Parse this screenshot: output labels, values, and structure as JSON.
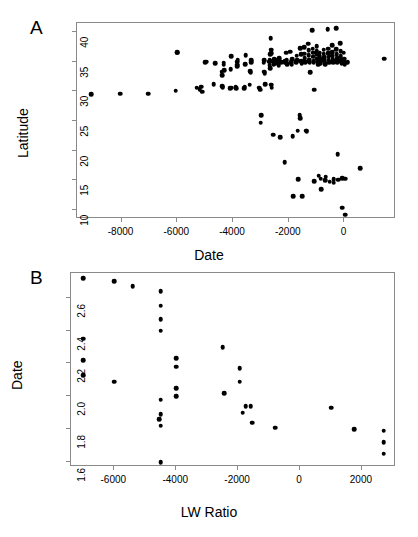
{
  "figure": {
    "panels": [
      {
        "label": "A",
        "xlabel": "Date",
        "ylabel": "Latitude",
        "xticks": [
          "-8000",
          "-6000",
          "-4000",
          "-2000",
          "0"
        ],
        "yticks": [
          "10",
          "15",
          "20",
          "25",
          "30",
          "35",
          "40"
        ]
      },
      {
        "label": "B",
        "xlabel": "LW Ratio",
        "ylabel": "Date",
        "xticks": [
          "-6000",
          "-4000",
          "-2000",
          "0",
          "2000"
        ],
        "yticks": [
          "1.6",
          "1.8",
          "2.0",
          "2.2",
          "2.4",
          "2.6"
        ]
      }
    ]
  },
  "chart_data": [
    {
      "type": "scatter",
      "panel": "A",
      "title": "",
      "xlabel": "Date",
      "ylabel": "Latitude",
      "xlim": [
        -9600,
        1850
      ],
      "ylim": [
        8.5,
        41.5
      ],
      "xticks": [
        -8000,
        -6000,
        -4000,
        -2000,
        0
      ],
      "yticks": [
        10,
        15,
        20,
        25,
        30,
        35,
        40
      ],
      "grid": false,
      "legend": "none",
      "marker": "filled-circle",
      "marker_color": "#000000",
      "points": [
        [
          -9100,
          29.5
        ],
        [
          -8050,
          29.6
        ],
        [
          -7050,
          29.6
        ],
        [
          -6050,
          30.1
        ],
        [
          -6000,
          36.6
        ],
        [
          -6010,
          36.5
        ],
        [
          -5300,
          30.6
        ],
        [
          -5200,
          30.4
        ],
        [
          -5150,
          30.8
        ],
        [
          -5100,
          29.9
        ],
        [
          -5000,
          34.9
        ],
        [
          -4950,
          35.0
        ],
        [
          -4700,
          31.2
        ],
        [
          -4650,
          34.7
        ],
        [
          -4400,
          33.3
        ],
        [
          -4390,
          32.7
        ],
        [
          -4380,
          30.9
        ],
        [
          -4370,
          30.7
        ],
        [
          -4340,
          34.8
        ],
        [
          -4330,
          34.5
        ],
        [
          -4320,
          33.6
        ],
        [
          -4100,
          30.5
        ],
        [
          -4080,
          33.7
        ],
        [
          -4060,
          35.9
        ],
        [
          -4050,
          30.6
        ],
        [
          -3900,
          30.7
        ],
        [
          -3880,
          30.5
        ],
        [
          -3860,
          34.5
        ],
        [
          -3850,
          34.2
        ],
        [
          -3840,
          35.0
        ],
        [
          -3830,
          35.3
        ],
        [
          -3600,
          30.5
        ],
        [
          -3580,
          30.8
        ],
        [
          -3560,
          34.6
        ],
        [
          -3550,
          36.1
        ],
        [
          -3400,
          31.1
        ],
        [
          -3380,
          33.4
        ],
        [
          -3360,
          33.1
        ],
        [
          -3350,
          34.9
        ],
        [
          -3340,
          35.2
        ],
        [
          -3050,
          30.6
        ],
        [
          -3030,
          30.3
        ],
        [
          -3000,
          24.7
        ],
        [
          -2990,
          26.0
        ],
        [
          -2900,
          34.8
        ],
        [
          -2880,
          35.2
        ],
        [
          -2870,
          33.3
        ],
        [
          -2860,
          33.0
        ],
        [
          -2850,
          31.2
        ],
        [
          -2700,
          35.0
        ],
        [
          -2690,
          35.3
        ],
        [
          -2680,
          34.4
        ],
        [
          -2670,
          33.9
        ],
        [
          -2660,
          36.2
        ],
        [
          -2650,
          38.9
        ],
        [
          -2640,
          37.0
        ],
        [
          -2630,
          36.4
        ],
        [
          -2620,
          31.1
        ],
        [
          -2610,
          30.6
        ],
        [
          -2550,
          22.7
        ],
        [
          -2560,
          35.1
        ],
        [
          -2540,
          34.6
        ],
        [
          -2530,
          35.4
        ],
        [
          -2500,
          34.9
        ],
        [
          -2490,
          35.2
        ],
        [
          -2480,
          34.7
        ],
        [
          -2400,
          34.8
        ],
        [
          -2380,
          35.0
        ],
        [
          -2360,
          34.4
        ],
        [
          -2340,
          35.6
        ],
        [
          -2300,
          22.3
        ],
        [
          -2280,
          35.0
        ],
        [
          -2260,
          34.9
        ],
        [
          -2150,
          18.1
        ],
        [
          -2140,
          35.1
        ],
        [
          -2120,
          34.8
        ],
        [
          -2100,
          36.5
        ],
        [
          -2080,
          35.2
        ],
        [
          -2060,
          34.6
        ],
        [
          -1950,
          36.7
        ],
        [
          -1930,
          35.0
        ],
        [
          -1920,
          34.8
        ],
        [
          -1900,
          34.5
        ],
        [
          -1880,
          35.4
        ],
        [
          -1860,
          22.4
        ],
        [
          -1850,
          12.3
        ],
        [
          -1750,
          35.0
        ],
        [
          -1730,
          34.9
        ],
        [
          -1720,
          36.0
        ],
        [
          -1700,
          35.2
        ],
        [
          -1680,
          23.4
        ],
        [
          -1660,
          15.2
        ],
        [
          -1600,
          26.0
        ],
        [
          -1590,
          25.5
        ],
        [
          -1580,
          37.3
        ],
        [
          -1560,
          36.2
        ],
        [
          -1550,
          35.1
        ],
        [
          -1540,
          34.7
        ],
        [
          -1520,
          12.3
        ],
        [
          -1450,
          37.4
        ],
        [
          -1440,
          36.3
        ],
        [
          -1430,
          35.6
        ],
        [
          -1420,
          35.0
        ],
        [
          -1400,
          34.9
        ],
        [
          -1380,
          23.4
        ],
        [
          -1360,
          23.3
        ],
        [
          -1300,
          38.0
        ],
        [
          -1290,
          36.9
        ],
        [
          -1280,
          36.1
        ],
        [
          -1270,
          35.3
        ],
        [
          -1260,
          35.0
        ],
        [
          -1250,
          34.8
        ],
        [
          -1240,
          33.2
        ],
        [
          -1150,
          40.3
        ],
        [
          -1140,
          37.2
        ],
        [
          -1130,
          36.5
        ],
        [
          -1120,
          35.8
        ],
        [
          -1110,
          35.1
        ],
        [
          -1100,
          34.9
        ],
        [
          -1090,
          30.3
        ],
        [
          -1080,
          14.9
        ],
        [
          -1000,
          37.6
        ],
        [
          -990,
          36.8
        ],
        [
          -980,
          36.2
        ],
        [
          -970,
          35.5
        ],
        [
          -960,
          35.1
        ],
        [
          -950,
          34.8
        ],
        [
          -940,
          34.5
        ],
        [
          -930,
          15.8
        ],
        [
          -900,
          36.5
        ],
        [
          -890,
          35.9
        ],
        [
          -880,
          35.4
        ],
        [
          -870,
          35.0
        ],
        [
          -860,
          34.7
        ],
        [
          -850,
          15.3
        ],
        [
          -840,
          13.5
        ],
        [
          -750,
          37.0
        ],
        [
          -740,
          36.3
        ],
        [
          -730,
          35.7
        ],
        [
          -720,
          35.2
        ],
        [
          -710,
          34.9
        ],
        [
          -700,
          34.6
        ],
        [
          -690,
          15.0
        ],
        [
          -680,
          15.6
        ],
        [
          -600,
          40.5
        ],
        [
          -590,
          37.2
        ],
        [
          -580,
          36.4
        ],
        [
          -570,
          35.8
        ],
        [
          -560,
          35.3
        ],
        [
          -550,
          35.0
        ],
        [
          -540,
          34.8
        ],
        [
          -530,
          14.8
        ],
        [
          -450,
          37.8
        ],
        [
          -440,
          36.6
        ],
        [
          -430,
          36.0
        ],
        [
          -420,
          35.4
        ],
        [
          -410,
          35.1
        ],
        [
          -400,
          34.9
        ],
        [
          -390,
          15.2
        ],
        [
          -380,
          14.6
        ],
        [
          -300,
          40.6
        ],
        [
          -290,
          37.1
        ],
        [
          -280,
          36.2
        ],
        [
          -270,
          35.6
        ],
        [
          -260,
          35.2
        ],
        [
          -250,
          34.9
        ],
        [
          -240,
          19.4
        ],
        [
          -230,
          15.1
        ],
        [
          -150,
          38.1
        ],
        [
          -140,
          36.8
        ],
        [
          -130,
          35.9
        ],
        [
          -120,
          35.3
        ],
        [
          -110,
          35.0
        ],
        [
          -100,
          34.7
        ],
        [
          -90,
          15.4
        ],
        [
          -80,
          10.4
        ],
        [
          -20,
          36.5
        ],
        [
          -10,
          35.5
        ],
        [
          0,
          34.9
        ],
        [
          10,
          34.6
        ],
        [
          20,
          15.3
        ],
        [
          30,
          9.2
        ],
        [
          100,
          34.8
        ],
        [
          110,
          35.0
        ],
        [
          560,
          17.1
        ],
        [
          1420,
          35.5
        ]
      ]
    },
    {
      "type": "scatter",
      "panel": "B",
      "title": "",
      "xlabel": "LW Ratio",
      "ylabel": "Date",
      "xlim": [
        -7400,
        3100
      ],
      "ylim": [
        1.57,
        2.75
      ],
      "xticks": [
        -6000,
        -4000,
        -2000,
        0,
        2000
      ],
      "yticks": [
        1.6,
        1.8,
        2.0,
        2.2,
        2.4,
        2.6
      ],
      "grid": false,
      "legend": "none",
      "marker": "filled-circle",
      "marker_color": "#000000",
      "points": [
        [
          -7000,
          2.72
        ],
        [
          -6000,
          2.7
        ],
        [
          -5400,
          2.67
        ],
        [
          -4500,
          2.64
        ],
        [
          -4500,
          2.55
        ],
        [
          -4500,
          2.47
        ],
        [
          -4500,
          2.4
        ],
        [
          -7000,
          2.35
        ],
        [
          -7000,
          2.22
        ],
        [
          -7000,
          2.13
        ],
        [
          -6000,
          2.09
        ],
        [
          -4000,
          2.23
        ],
        [
          -4000,
          2.18
        ],
        [
          -2500,
          2.3
        ],
        [
          -1950,
          2.17
        ],
        [
          -1950,
          2.09
        ],
        [
          -4000,
          2.05
        ],
        [
          -4000,
          2.0
        ],
        [
          -4500,
          1.98
        ],
        [
          -2450,
          2.02
        ],
        [
          -1750,
          1.94
        ],
        [
          -1600,
          1.94
        ],
        [
          -1850,
          1.9
        ],
        [
          -4500,
          1.89
        ],
        [
          -4550,
          1.86
        ],
        [
          -4500,
          1.82
        ],
        [
          -1550,
          1.84
        ],
        [
          -800,
          1.81
        ],
        [
          1000,
          1.93
        ],
        [
          1750,
          1.8
        ],
        [
          2700,
          1.79
        ],
        [
          2700,
          1.72
        ],
        [
          2700,
          1.65
        ],
        [
          -4500,
          1.6
        ]
      ]
    }
  ]
}
